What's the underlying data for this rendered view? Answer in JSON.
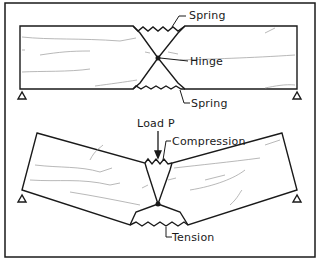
{
  "figure": {
    "top_panel": {
      "labels": {
        "spring_top": "Spring",
        "hinge": "Hinge",
        "spring_bottom": "Spring"
      }
    },
    "bottom_panel": {
      "labels": {
        "load": "Load P",
        "compression": "Compression",
        "tension": "Tension"
      }
    },
    "colors": {
      "line": "#1a1a1a",
      "grain": "#9a9a9a",
      "background": "#ffffff"
    }
  }
}
